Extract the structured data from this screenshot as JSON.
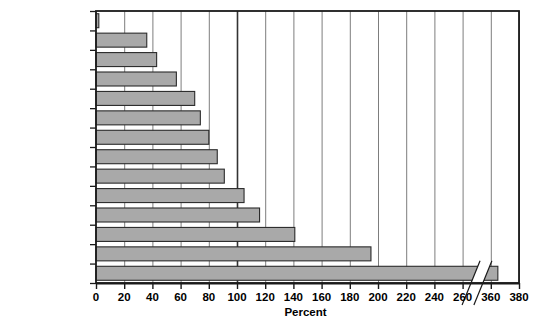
{
  "chart_data": {
    "type": "bar",
    "orientation": "horizontal",
    "title": "",
    "subtitle": "",
    "xlabel": "Percent",
    "ylabel": "",
    "categories": [
      "Coffee",
      "Lead",
      "Oil",
      "Aluminum",
      "Copper",
      "Sugar",
      "Zinc",
      "Rubber",
      "Natual Gas",
      "Coal",
      "Coarse Grains",
      "Oil Seeds",
      "Wheat",
      "Cotton"
    ],
    "values": [
      2,
      36,
      43,
      57,
      70,
      74,
      80,
      86,
      91,
      105,
      116,
      141,
      195,
      365
    ],
    "series": [
      {
        "name": "Percent",
        "values": [
          2,
          36,
          43,
          57,
          70,
          74,
          80,
          86,
          91,
          105,
          116,
          141,
          195,
          365
        ]
      }
    ],
    "xlim": [
      0,
      380
    ],
    "x_ticks": [
      0,
      20,
      40,
      60,
      80,
      100,
      120,
      140,
      160,
      180,
      200,
      220,
      240,
      260,
      360,
      380
    ],
    "x_tick_labels": [
      "0",
      "20",
      "40",
      "60",
      "80",
      "100",
      "120",
      "140",
      "160",
      "180",
      "200",
      "220",
      "240",
      "260",
      "360",
      "380"
    ],
    "axis_break": {
      "present": true,
      "after_value": 260,
      "resume_value": 360
    },
    "grid": {
      "vertical": true,
      "horizontal": false,
      "emphasized_gridlines": [
        100
      ]
    },
    "legend": {
      "present": false,
      "position": "none"
    },
    "colors": {
      "bar_fill": "#a9a9a9",
      "bar_stroke": "#2b2b2b",
      "gridline": "#6e6e6e",
      "emphasis_gridline": "#333333",
      "frame": "#1a1a1a",
      "plot_background": "#ffffff",
      "text": "#000000"
    }
  }
}
